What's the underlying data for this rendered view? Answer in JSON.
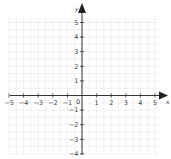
{
  "chart_data": {
    "type": "scatter",
    "title": "",
    "xlabel": "x",
    "ylabel": "y",
    "xlim": [
      -5,
      5
    ],
    "ylim": [
      -4,
      5
    ],
    "grid": true,
    "x_ticks": [
      "-5",
      "-4",
      "-3",
      "-2",
      "-1",
      "0",
      "1",
      "2",
      "3",
      "4",
      "5"
    ],
    "y_ticks": [
      "-4",
      "-3",
      "-2",
      "-1",
      "1",
      "2",
      "3",
      "4",
      "5"
    ],
    "points": []
  },
  "labels": {
    "x_axis": "x",
    "y_axis": "y",
    "origin": "0"
  },
  "colors": {
    "grid": "#e6e6e6",
    "axis": "#333333",
    "text": "#444444"
  }
}
